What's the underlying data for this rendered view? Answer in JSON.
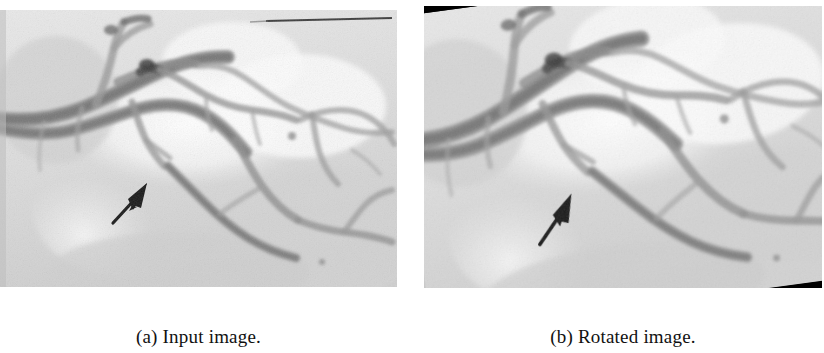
{
  "figure": {
    "kind": "two-panel-figure",
    "panel_gap_color": "#ffffff",
    "page_background": "#ffffff"
  },
  "panels": [
    {
      "id": "a",
      "caption": "(a) Input image.",
      "modality": "x-ray coronary angiogram",
      "annotation": "black arrow pointing up-right at a vessel segment",
      "marker": "thin dark horizontal line near top-right",
      "rotation_degrees": 0,
      "background_fill": "#ffffff"
    },
    {
      "id": "b",
      "caption": "(b) Rotated image.",
      "modality": "x-ray coronary angiogram",
      "annotation": "black arrow pointing up-right at a vessel segment",
      "rotation_degrees": -7.6,
      "background_fill": "#000000"
    }
  ],
  "colors": {
    "vessel_dark": "#6f6f6f",
    "vessel_mid": "#8f8f8f",
    "tissue_light": "#dedede",
    "tissue_bright": "#f2f2f2",
    "arrow": "#1a1a1a",
    "rotation_fill": "#000000",
    "caption_text": "#111111"
  }
}
